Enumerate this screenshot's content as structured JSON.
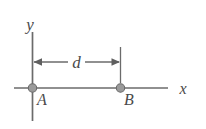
{
  "figure": {
    "background_color": "#ffffff",
    "line_color": "#6b6b6b",
    "marker_color": "#9a9a9a",
    "marker_edge_color": "#6b6b6b",
    "text_color": "#4a4a4a",
    "width": 206,
    "height": 129
  },
  "axes": {
    "y_axis_label": "y",
    "x_axis_label": "x"
  },
  "points": [
    {
      "label": "A",
      "x": 0,
      "description": "point-at-origin"
    },
    {
      "label": "B",
      "x": 1,
      "description": "point-on-x-axis"
    }
  ],
  "dimension": {
    "label": "d",
    "from_point": "A",
    "to_point": "B",
    "description": "separation-between-A-and-B"
  }
}
